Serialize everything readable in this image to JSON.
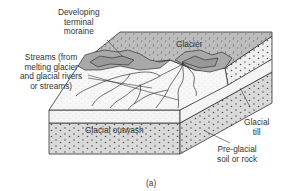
{
  "diagram": {
    "type": "block diagram",
    "caption": "(a)",
    "labels": {
      "moraine": [
        "Developing",
        "terminal",
        "moraine"
      ],
      "streams": [
        "Streams (from",
        "melting glacier",
        "and glacial rivers",
        "or streams)"
      ],
      "glacier": "Glacier",
      "outwash": "Glacial outwash",
      "till": [
        "Glacial",
        "till"
      ],
      "preglacial": [
        "Pre-glacial",
        "soil or rock"
      ]
    },
    "colors": {
      "glacier_fill": "#bdbdbd",
      "moraine_fill": "#a9a9a9",
      "outwash_fill": "#f4f4f4",
      "substrate_fill": "#d9d9d9",
      "line": "#333333"
    }
  }
}
